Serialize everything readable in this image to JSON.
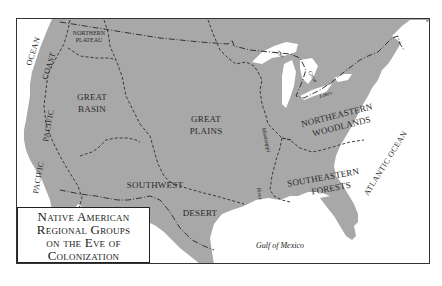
{
  "map": {
    "title_lines": [
      "Native American",
      "Regional Groups",
      "on the Eve of",
      "Colonization"
    ],
    "regions": {
      "northern_plateau": [
        "NORTHERN",
        "PLATEAU"
      ],
      "great_basin": [
        "GREAT",
        "BASIN"
      ],
      "great_plains": [
        "GREAT",
        "PLAINS"
      ],
      "northeastern_woodlands": [
        "NORTHEASTERN",
        "WOODLANDS"
      ],
      "southwest": "SOUTHWEST",
      "desert": "DESERT",
      "southeastern_forests": [
        "SOUTHEASTERN",
        "FORESTS"
      ]
    },
    "water": {
      "ocean_nw": "OCEAN",
      "coast": "COAST",
      "pacific_upper": "PACIFIC",
      "pacific_lower": "PACIFIC",
      "atlantic": "ATLANTIC OCEAN",
      "gulf": "Gulf of Mexico",
      "great_lakes": [
        "The",
        "Great",
        "Lakes"
      ],
      "mississippi": "Mississippi",
      "river": "River"
    },
    "colors": {
      "land": "#a8a8a8",
      "water": "#ffffff",
      "frame": "#333333",
      "text": "#2a2a2a"
    }
  }
}
